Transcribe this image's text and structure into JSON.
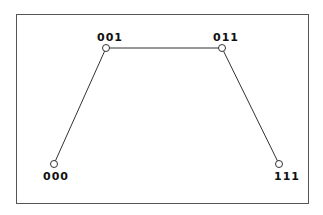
{
  "diagram": {
    "nodes": [
      {
        "id": "000",
        "label": "000",
        "x": 54,
        "y": 164
      },
      {
        "id": "001",
        "label": "001",
        "x": 106,
        "y": 48
      },
      {
        "id": "011",
        "label": "011",
        "x": 222,
        "y": 48
      },
      {
        "id": "111",
        "label": "111",
        "x": 279,
        "y": 164
      }
    ],
    "edges": [
      {
        "from": "000",
        "to": "001"
      },
      {
        "from": "001",
        "to": "011"
      },
      {
        "from": "011",
        "to": "111"
      }
    ],
    "colors": {
      "stroke": "#333333",
      "border": "#555555"
    }
  }
}
